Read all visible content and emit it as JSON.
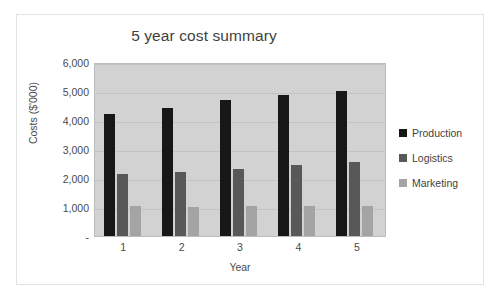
{
  "page": {
    "top_strip_text": ""
  },
  "chart_data": {
    "type": "bar",
    "title": "5 year cost summary",
    "xlabel": "Year",
    "ylabel": "Costs ($'000)",
    "categories": [
      "1",
      "2",
      "3",
      "4",
      "5"
    ],
    "series": [
      {
        "name": "Production",
        "color": "#171717",
        "values": [
          4200,
          4400,
          4700,
          4850,
          5000
        ]
      },
      {
        "name": "Logistics",
        "color": "#585858",
        "values": [
          2150,
          2200,
          2300,
          2450,
          2550
        ]
      },
      {
        "name": "Marketing",
        "color": "#a4a4a4",
        "values": [
          1020,
          1000,
          1020,
          1030,
          1050
        ]
      }
    ],
    "ylim": [
      0,
      6000
    ],
    "ytick_values": [
      0,
      1000,
      2000,
      3000,
      4000,
      5000,
      6000
    ],
    "ytick_labels": [
      "-",
      "1,000",
      "2,000",
      "3,000",
      "4,000",
      "5,000",
      "6,000"
    ],
    "grid": true,
    "legend_position": "right",
    "plot_background": "#d2d2d2",
    "gridline_color": "#c3c3c3"
  }
}
